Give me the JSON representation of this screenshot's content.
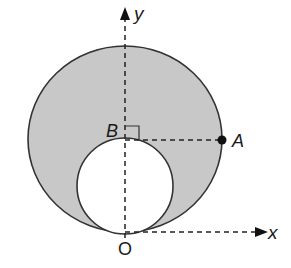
{
  "diagram": {
    "labels": {
      "y_axis": "y",
      "x_axis": "x",
      "origin": "O",
      "point_a": "A",
      "point_b": "B"
    },
    "colors": {
      "shaded_region": "#c8c8c8",
      "stroke": "#333333",
      "inner_fill": "#ffffff"
    },
    "shapes": {
      "outer_circle": "large circle tangent to x-axis at O, passing through A",
      "inner_circle": "small circle tangent to outer circle at O, top at B",
      "shaded_region": "area between outer and inner circles",
      "right_angle_marker": "at B, between y-axis and segment BA"
    }
  }
}
